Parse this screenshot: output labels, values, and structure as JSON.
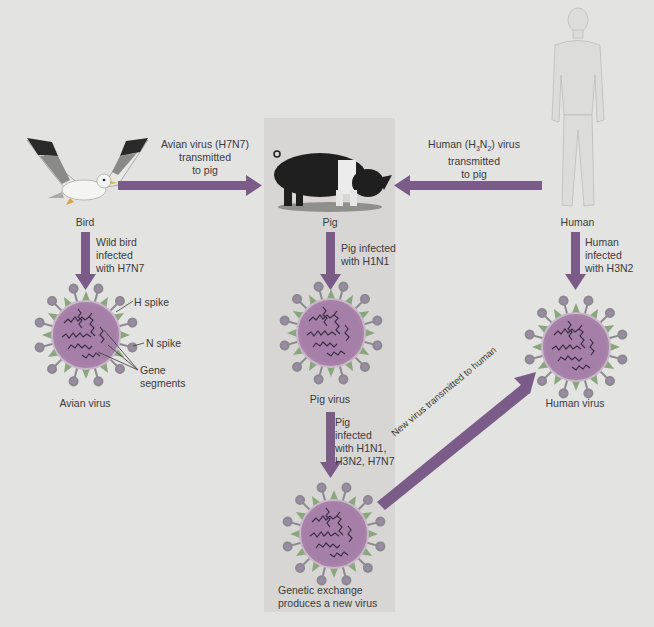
{
  "diagram": {
    "colors": {
      "background": "#e3e3e2",
      "panel": "#d7d6d4",
      "arrow": "#7b5c88",
      "virus_body": "#a77fa8",
      "virus_spike_ball": "#8f7a9a",
      "virus_spike_triangle": "#8aa67c",
      "gene_segments": "#3b2d45"
    },
    "hosts": {
      "bird": {
        "label": "Bird"
      },
      "pig": {
        "label": "Pig"
      },
      "human": {
        "label": "Human"
      }
    },
    "arrows": {
      "bird_to_pig": {
        "line1": "Avian virus (H7N7)",
        "line2": "transmitted",
        "line3": "to pig"
      },
      "human_to_pig": {
        "prefix": "Human (H",
        "sub1": "3",
        "mid": "N",
        "sub2": "2",
        "suffix": ") virus",
        "line2": "transmitted",
        "line3": "to pig"
      },
      "bird_to_virus": {
        "line1": "Wild bird",
        "line2": "infected",
        "line3": "with H7N7"
      },
      "pig_to_virus": {
        "line1": "Pig infected",
        "line2": "with H1N1"
      },
      "human_to_virus": {
        "line1": "Human",
        "line2": "infected",
        "line3": "with H3N2"
      },
      "pig_virus_to_new": {
        "line1": "Pig",
        "line2": "infected",
        "line3": "with H1N1,",
        "line4": "H3N2, H7N7"
      },
      "new_to_human": {
        "label": "New virus transmitted to human"
      }
    },
    "viruses": {
      "avian": {
        "label": "Avian virus"
      },
      "pig": {
        "label": "Pig virus"
      },
      "human": {
        "label": "Human virus"
      },
      "new": {
        "line1": "Genetic exchange",
        "line2": "produces a new virus"
      }
    },
    "annotations": {
      "h_spike": "H spike",
      "n_spike": "N spike",
      "gene_line1": "Gene",
      "gene_line2": "segments"
    }
  }
}
